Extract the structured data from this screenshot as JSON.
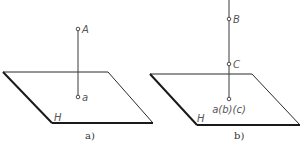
{
  "figure": {
    "panels": [
      {
        "caption": "a)",
        "plane_label": "H",
        "points": [
          {
            "label": "A",
            "role": "space-point"
          },
          {
            "label": "a",
            "role": "projection"
          }
        ]
      },
      {
        "caption": "b)",
        "plane_label": "H",
        "points": [
          {
            "label": "B",
            "role": "space-point"
          },
          {
            "label": "C",
            "role": "space-point"
          },
          {
            "label": "a(b)(c)",
            "role": "coincident-projection"
          }
        ]
      }
    ],
    "colors": {
      "line": "#2a2a2a",
      "label": "#555555",
      "background": "#ffffff"
    }
  }
}
